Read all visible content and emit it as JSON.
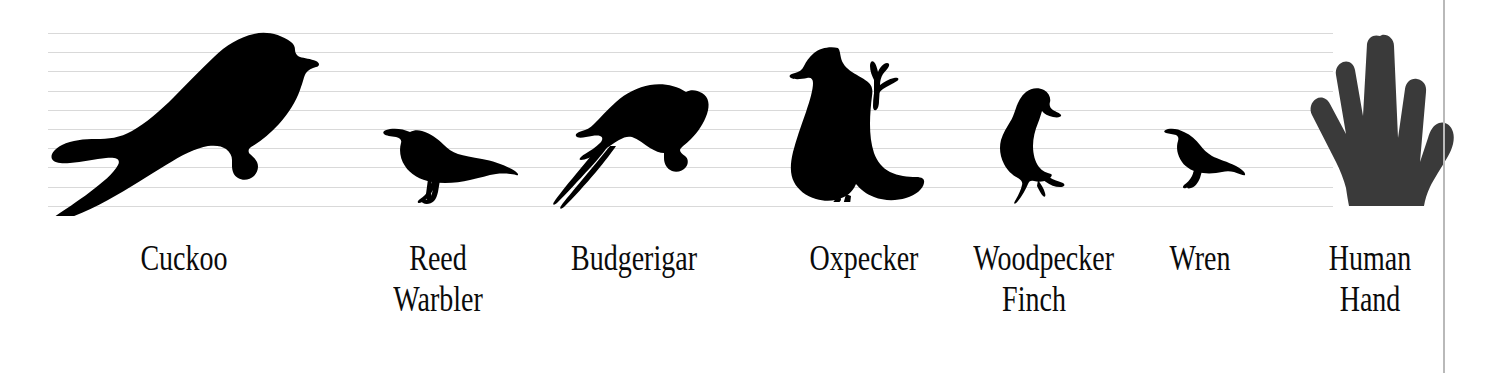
{
  "figure": {
    "type": "size-comparison-silhouette-chart",
    "background_color": "#ffffff",
    "gridline_color": "#d9d9d9",
    "gridline_count": 10,
    "vertical_rule_color": "#b9b9b9",
    "silhouette_color": "#000000",
    "hand_color": "#3a3a3a"
  },
  "items": [
    {
      "id": "cuckoo",
      "label": "Cuckoo",
      "icon": "cuckoo-silhouette-icon",
      "color": "#000000"
    },
    {
      "id": "reed-warbler",
      "label": "Reed Warbler",
      "icon": "reed-warbler-silhouette-icon",
      "color": "#000000"
    },
    {
      "id": "budgerigar",
      "label": "Budgerigar",
      "icon": "budgerigar-silhouette-icon",
      "color": "#000000"
    },
    {
      "id": "oxpecker",
      "label": "Oxpecker",
      "icon": "oxpecker-silhouette-icon",
      "color": "#000000"
    },
    {
      "id": "woodpecker-finch",
      "label": "Woodpecker\nFinch",
      "icon": "woodpecker-finch-silhouette-icon",
      "color": "#000000"
    },
    {
      "id": "wren",
      "label": "Wren",
      "icon": "wren-silhouette-icon",
      "color": "#000000"
    },
    {
      "id": "human-hand",
      "label": "Human\nHand",
      "icon": "human-hand-silhouette-icon",
      "color": "#3a3a3a"
    }
  ]
}
